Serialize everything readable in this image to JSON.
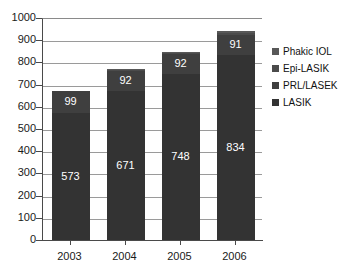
{
  "chart_data": {
    "type": "bar",
    "subtype": "stacked",
    "title": "",
    "xlabel": "",
    "ylabel": "",
    "categories": [
      "2003",
      "2004",
      "2005",
      "2006"
    ],
    "ylim": [
      0,
      1000
    ],
    "ytick_step": 100,
    "ytick_labels": [
      "0",
      "100",
      "200",
      "300",
      "400",
      "500",
      "600",
      "700",
      "800",
      "900",
      "1000"
    ],
    "grid": true,
    "legend_position": "right",
    "series": [
      {
        "name": "LASIK",
        "color": "#333333",
        "values": [
          573,
          671,
          748,
          834
        ],
        "labels": [
          "573",
          "671",
          "748",
          "834"
        ]
      },
      {
        "name": "PRL/LASEK",
        "color": "#3f3f3f",
        "values": [
          99,
          92,
          92,
          91
        ],
        "labels": [
          "99",
          "92",
          "92",
          "91"
        ]
      },
      {
        "name": "Epi-LASIK",
        "color": "#4b4b4b",
        "values": [
          0,
          2,
          4,
          9
        ],
        "labels": [
          "",
          "2",
          "4",
          "9"
        ]
      },
      {
        "name": "Phakic IOL",
        "color": "#585858",
        "values": [
          0,
          6,
          2,
          8
        ],
        "labels": [
          "",
          "",
          "",
          ""
        ]
      }
    ],
    "totals": [
      672,
      771,
      846,
      942
    ]
  },
  "legend": {
    "items": [
      {
        "label": "Phakic IOL",
        "color": "#585858"
      },
      {
        "label": "Epi-LASIK",
        "color": "#4b4b4b"
      },
      {
        "label": "PRL/LASEK",
        "color": "#3f3f3f"
      },
      {
        "label": "LASIK",
        "color": "#333333"
      }
    ]
  }
}
